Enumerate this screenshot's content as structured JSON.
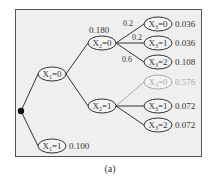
{
  "caption": "(a)",
  "colors": {
    "frame_bg": "#efefef",
    "ink": "#333333",
    "faded": "#aaaaaa"
  },
  "root": {
    "x": 21,
    "y": 111
  },
  "nodes": [
    {
      "id": "x1_0",
      "var": "X",
      "sub": "1",
      "val": "0",
      "x": 52,
      "y": 74,
      "value": "",
      "faded": false
    },
    {
      "id": "x1_1",
      "var": "X",
      "sub": "1",
      "val": "1",
      "x": 52,
      "y": 146,
      "value": "0.100",
      "faded": false
    },
    {
      "id": "x2_0",
      "var": "X",
      "sub": "2",
      "val": "0",
      "x": 102,
      "y": 43,
      "value": "",
      "faded": false,
      "top_label": "0.180"
    },
    {
      "id": "x2_1",
      "var": "X",
      "sub": "2",
      "val": "1",
      "x": 102,
      "y": 106,
      "value": "",
      "faded": false
    },
    {
      "id": "x3_00",
      "var": "X",
      "sub": "3",
      "val": "0",
      "x": 158,
      "y": 24,
      "value": "0.036",
      "faded": false
    },
    {
      "id": "x3_01",
      "var": "X",
      "sub": "3",
      "val": "1",
      "x": 158,
      "y": 43,
      "value": "0.036",
      "faded": false
    },
    {
      "id": "x3_02",
      "var": "X",
      "sub": "3",
      "val": "2",
      "x": 158,
      "y": 62,
      "value": "0.108",
      "faded": false
    },
    {
      "id": "x3_10",
      "var": "X",
      "sub": "3",
      "val": "0",
      "x": 158,
      "y": 82,
      "value": "0.576",
      "faded": true
    },
    {
      "id": "x3_11",
      "var": "X",
      "sub": "3",
      "val": "1",
      "x": 158,
      "y": 106,
      "value": "0.072",
      "faded": false
    },
    {
      "id": "x3_12",
      "var": "X",
      "sub": "3",
      "val": "2",
      "x": 158,
      "y": 125,
      "value": "0.072",
      "faded": false
    }
  ],
  "edges": [
    {
      "from": "root",
      "to": "x1_0",
      "label": "",
      "faded": false
    },
    {
      "from": "root",
      "to": "x1_1",
      "label": "",
      "faded": false
    },
    {
      "from": "x1_0",
      "to": "x2_0",
      "label": "",
      "faded": false
    },
    {
      "from": "x1_0",
      "to": "x2_1",
      "label": "",
      "faded": false
    },
    {
      "from": "x2_0",
      "to": "x3_00",
      "label": "0.2",
      "lx": 128,
      "ly": 26,
      "faded": false
    },
    {
      "from": "x2_0",
      "to": "x3_01",
      "label": "0.2",
      "lx": 137,
      "ly": 40,
      "faded": false
    },
    {
      "from": "x2_0",
      "to": "x3_02",
      "label": "0.6",
      "lx": 127,
      "ly": 62,
      "faded": false
    },
    {
      "from": "x2_1",
      "to": "x3_10",
      "label": "",
      "faded": true
    },
    {
      "from": "x2_1",
      "to": "x3_11",
      "label": "",
      "faded": false
    },
    {
      "from": "x2_1",
      "to": "x3_12",
      "label": "",
      "faded": false
    }
  ]
}
